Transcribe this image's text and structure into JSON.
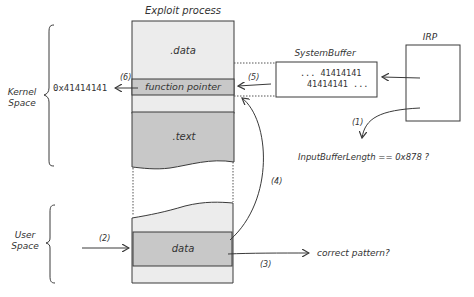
{
  "diagram": {
    "title": "Exploit process",
    "regions": {
      "kernel_label_line1": "Kernel",
      "kernel_label_line2": "Space",
      "user_label_line1": "User",
      "user_label_line2": "Space"
    },
    "process_segments": {
      "data_section": ".data",
      "function_pointer": "function pointer",
      "text_section": ".text",
      "user_data": "data"
    },
    "system_buffer": {
      "title": "SystemBuffer",
      "line1": "... 41414141",
      "line2": "41414141 ..."
    },
    "irp": {
      "title": "IRP"
    },
    "check_length": "InputBufferLength == 0x878 ?",
    "check_pattern": "correct pattern?",
    "overwritten_value": "0x41414141",
    "steps": {
      "s1": "(1)",
      "s2": "(2)",
      "s3": "(3)",
      "s4": "(4)",
      "s5": "(5)",
      "s6": "(6)"
    },
    "colors": {
      "light_fill": "#ececec",
      "dark_fill": "#c8c8c8",
      "stroke": "#3a3a3a"
    }
  }
}
